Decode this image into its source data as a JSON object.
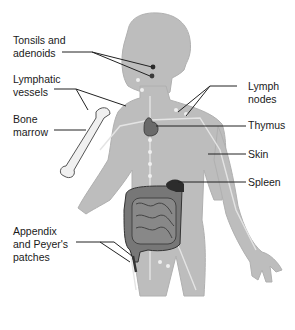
{
  "diagram": {
    "colors": {
      "body": "#bdbdbd",
      "body_outline": "#a8a8a8",
      "vessel": "#e6e6e6",
      "bone": "#efefef",
      "organ": "#6f6f6f",
      "organ_dark": "#3a3a3a",
      "leader_line": "#222222",
      "text": "#1a1a1a"
    },
    "labels": [
      {
        "id": "tonsils",
        "text": "Tonsils and\nadenoids",
        "side": "left"
      },
      {
        "id": "lymphatic-vessels",
        "text": "Lymphatic\nvessels",
        "side": "left"
      },
      {
        "id": "bone-marrow",
        "text": "Bone\nmarrow",
        "side": "left"
      },
      {
        "id": "appendix",
        "text": "Appendix\nand Peyer's\npatches",
        "side": "left"
      },
      {
        "id": "lymph-nodes",
        "text": "Lymph\nnodes",
        "side": "right"
      },
      {
        "id": "thymus",
        "text": "Thymus",
        "side": "right"
      },
      {
        "id": "skin",
        "text": "Skin",
        "side": "right"
      },
      {
        "id": "spleen",
        "text": "Spleen",
        "side": "right"
      }
    ]
  }
}
